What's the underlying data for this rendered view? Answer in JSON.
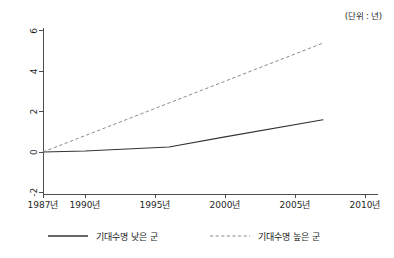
{
  "unit_note": "(단위 : 년)",
  "chart_data": {
    "type": "line",
    "title": "",
    "xlabel": "",
    "ylabel": "",
    "unit_note": "(단위 : 년)",
    "grid": false,
    "legend_position": "bottom",
    "xlim": [
      1987,
      2010
    ],
    "ylim": [
      -2,
      6
    ],
    "x_tick_labels": [
      "1987년",
      "1990년",
      "1995년",
      "2000년",
      "2005년",
      "2010년"
    ],
    "x_tick_values": [
      1987,
      1990,
      1995,
      2000,
      2005,
      2010
    ],
    "y_tick_labels": [
      "-2",
      "0",
      "2",
      "4",
      "6"
    ],
    "y_tick_values": [
      -2,
      0,
      2,
      4,
      6
    ],
    "series": [
      {
        "name": "기대수명 낮은 군",
        "style": "solid",
        "color": "#333333",
        "x": [
          1987,
          1990,
          1996,
          2000,
          2007
        ],
        "values": [
          0.0,
          0.05,
          0.25,
          0.75,
          1.6
        ]
      },
      {
        "name": "기대수명 높은 군",
        "style": "dashed",
        "color": "#8c8c8c",
        "x": [
          1987,
          2007
        ],
        "values": [
          0.0,
          5.4
        ]
      }
    ]
  },
  "legend": {
    "items": [
      {
        "label": "기대수명 낮은 군",
        "style": "solid"
      },
      {
        "label": "기대수명 높은 군",
        "style": "dashed"
      }
    ]
  }
}
